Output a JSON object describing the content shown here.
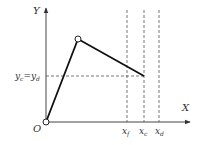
{
  "diagram": {
    "axes": {
      "y_label": "Y",
      "x_label": "X",
      "origin_label": "O"
    },
    "horizontal_guide": {
      "label_left": "y",
      "label_left_sub": "c",
      "label_eq": "=",
      "label_right": "y",
      "label_right_sub": "d"
    },
    "vertical_guides": [
      {
        "label": "x",
        "sub": "f"
      },
      {
        "label": "x",
        "sub": "c"
      },
      {
        "label": "x",
        "sub": "d"
      }
    ],
    "polyline_points": [
      {
        "name": "origin",
        "x": 0,
        "y": 0
      },
      {
        "name": "peak",
        "x": 1,
        "y": 2.3
      },
      {
        "name": "end",
        "x": 3.1,
        "y": 1.3
      }
    ],
    "colors": {
      "line": "#111111",
      "axis": "#444444",
      "dash": "#555555"
    }
  }
}
